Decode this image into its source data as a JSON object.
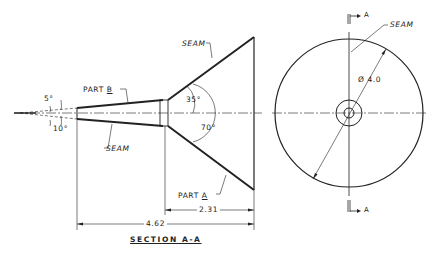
{
  "drawing": {
    "title": "SECTION A-A",
    "section_view": {
      "labels": {
        "seam_top": "SEAM",
        "seam_bottom": "SEAM",
        "part_b_prefix": "PART",
        "part_b_letter": "B",
        "part_a_prefix": "PART",
        "part_a_letter": "A"
      },
      "angles": {
        "half_angle_small_top": "5°",
        "included_small": "10°",
        "half_angle_large": "35°",
        "included_large": "70°"
      },
      "dimensions": {
        "large_cone_length": "2.31",
        "overall_length": "4.62"
      }
    },
    "end_view": {
      "seam_label": "SEAM",
      "diameter": "Ø 4.0",
      "section_marker_top": "A",
      "section_marker_bottom": "A"
    },
    "colors": {
      "line": "#222222",
      "background": "#ffffff"
    }
  }
}
